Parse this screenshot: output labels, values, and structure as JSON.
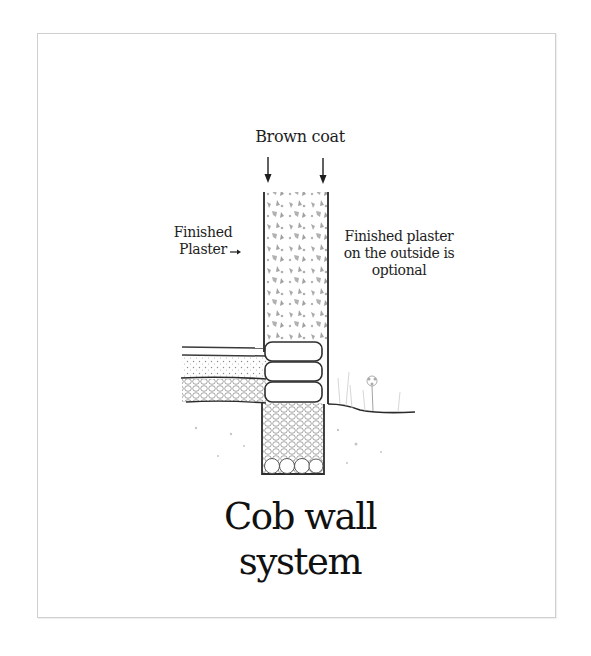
{
  "diagram": {
    "title": "Cob wall system",
    "labels": {
      "brown_coat": "Brown coat",
      "finished_plaster_line1": "Finished",
      "finished_plaster_line2": "Plaster",
      "outside_line1": "Finished plaster",
      "outside_line2": "on the outside is",
      "outside_line3": "optional"
    },
    "arrows": {
      "brown_coat_left": "down-arrow",
      "brown_coat_right": "down-arrow",
      "finished_plaster": "right-arrow"
    },
    "components": [
      "cob wall (brown coat fill)",
      "interior floor slab",
      "floor insulation layer",
      "gravel layer",
      "stem wall (3 stacked stones/bags)",
      "rubble trench foundation",
      "large drainage stones",
      "exterior ground line",
      "exterior plant"
    ],
    "colors": {
      "ink": "#2a2a2a",
      "fill_gray": "#9a9a9a",
      "frame": "#cfcfcf",
      "background": "#ffffff"
    }
  }
}
